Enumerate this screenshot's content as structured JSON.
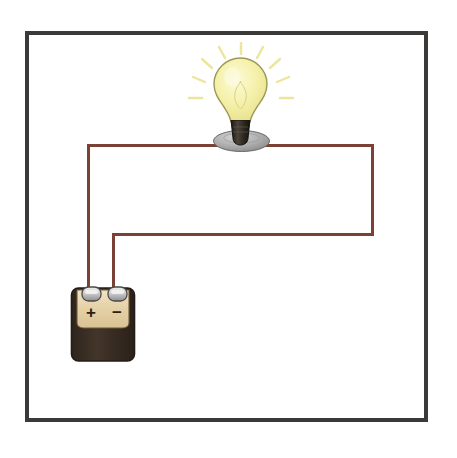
{
  "diagram": {
    "background_color": "#ffffff"
  },
  "frame": {
    "name": "diagram-border",
    "color": "#3b3a38",
    "stroke_width": 4,
    "x": 25,
    "y": 31,
    "width": 403,
    "height": 391
  },
  "wires": {
    "color": "#7a4134",
    "highlight_color": "#a97a66",
    "stroke_width": 3,
    "segments": [
      {
        "name": "wire-left-vertical",
        "orientation": "vertical",
        "x": 87,
        "y1": 144,
        "y2": 292
      },
      {
        "name": "wire-top-left-horizontal",
        "orientation": "horizontal",
        "y": 144,
        "x1": 87,
        "x2": 222
      },
      {
        "name": "wire-top-right-horizontal",
        "orientation": "horizontal",
        "y": 144,
        "x1": 258,
        "x2": 374
      },
      {
        "name": "wire-right-vertical",
        "orientation": "vertical",
        "x": 371,
        "y1": 144,
        "y2": 236
      },
      {
        "name": "wire-bottom-horizontal",
        "orientation": "horizontal",
        "y": 233,
        "x1": 112,
        "x2": 374
      },
      {
        "name": "wire-return-vertical",
        "orientation": "vertical",
        "x": 112,
        "y1": 233,
        "y2": 292
      }
    ]
  },
  "bulb": {
    "name": "light-bulb",
    "state": "lit",
    "glass_color": "#f4f0a9",
    "glass_highlight": "#fbfad2",
    "glass_outline": "#9a9a55",
    "base_color": "#3a352c",
    "base_outline": "#1f1c16",
    "ray_color": "#ece58a",
    "ray_count": 9
  },
  "socket": {
    "name": "bulb-socket",
    "fill_color": "#a9a9a9",
    "highlight_color": "#cfcfcf",
    "outline_color": "#6b6b6b"
  },
  "battery": {
    "name": "battery",
    "top_panel_color": "#e4cfa4",
    "top_panel_highlight": "#f0e2c3",
    "body_color": "#3b3028",
    "outline_color": "#241c16",
    "terminal_color": "#c3c3c3",
    "terminal_highlight": "#efefef",
    "terminal_outline": "#4a4a4a",
    "positive_label": "+",
    "negative_label": "−",
    "label_color": "#2a2018",
    "terminals": [
      {
        "name": "terminal-positive",
        "polarity": "positive",
        "x": 91,
        "y": 294
      },
      {
        "name": "terminal-negative",
        "polarity": "negative",
        "x": 117,
        "y": 294
      }
    ]
  }
}
